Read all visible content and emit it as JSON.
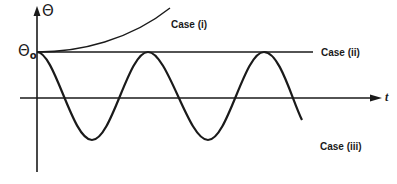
{
  "diagram": {
    "y_axis_label": "Θ",
    "theta_zero_label": "Θ",
    "theta_zero_subscript": "o",
    "x_axis_label": "t",
    "cases": [
      {
        "id": "i",
        "label": "Case (i)",
        "description": "growing curve above Θo"
      },
      {
        "id": "ii",
        "label": "Case (ii)",
        "description": "constant Θ = Θo"
      },
      {
        "id": "iii",
        "label": "Case (iii)",
        "description": "oscillation between Θo and -Θo"
      }
    ],
    "colors": {
      "stroke": "#1a1a1a",
      "background": "#ffffff"
    }
  }
}
